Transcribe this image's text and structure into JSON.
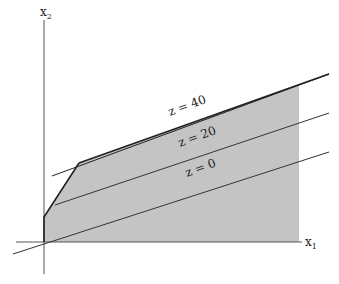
{
  "diagram": {
    "axes": {
      "x_label": "x",
      "x_sub": "1",
      "y_label": "x",
      "y_sub": "2"
    },
    "feasible_region": {
      "fill": "#c4c4c4",
      "vertices": [
        [
          44,
          242
        ],
        [
          44,
          217
        ],
        [
          79,
          163
        ],
        [
          299,
          85
        ],
        [
          299,
          242
        ]
      ]
    },
    "objective_lines": [
      {
        "label": "z = 40",
        "x1": 52,
        "y1": 176,
        "x2": 329,
        "y2": 74,
        "lx": 128,
        "ly": 150,
        "angle": -20
      },
      {
        "label": "z = 20",
        "x1": 55,
        "y1": 205,
        "x2": 329,
        "y2": 113,
        "lx": 178,
        "ly": 146,
        "angle": -20
      },
      {
        "label": "z = 0",
        "x1": 13,
        "y1": 254,
        "x2": 329,
        "y2": 152,
        "lx": 184,
        "ly": 176,
        "angle": -20
      }
    ]
  }
}
